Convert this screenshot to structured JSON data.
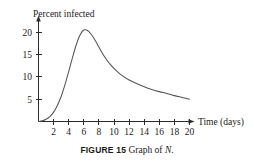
{
  "caption": {
    "figure_number": "FIGURE 15",
    "text": "Graph of",
    "symbol": "N",
    "terminator": "."
  },
  "chart_data": {
    "type": "line",
    "title": "",
    "xlabel": "Time (days)",
    "ylabel": "Percent infected",
    "xlim": [
      0,
      21.5
    ],
    "ylim": [
      0,
      23
    ],
    "grid": false,
    "legend": null,
    "x_ticks": [
      2,
      4,
      6,
      8,
      10,
      12,
      14,
      16,
      18,
      20
    ],
    "x_tick_labels": [
      "2",
      "4",
      "6",
      "8",
      "10",
      "12",
      "14",
      "16",
      "18",
      "20"
    ],
    "y_ticks": [
      5,
      10,
      15,
      20
    ],
    "y_tick_labels": [
      "5",
      "10",
      "15",
      "20"
    ],
    "series": [
      {
        "name": "N",
        "x": [
          0,
          0.5,
          1,
          1.5,
          2,
          2.5,
          3,
          3.5,
          4,
          4.5,
          5,
          5.5,
          6,
          6.5,
          7,
          7.5,
          8,
          8.5,
          9,
          9.5,
          10,
          11,
          12,
          13,
          14,
          15,
          16,
          17,
          18,
          19,
          20
        ],
        "y": [
          0,
          0.15,
          0.5,
          1.1,
          2.1,
          3.6,
          5.6,
          8.2,
          11.2,
          14.3,
          17.2,
          19.4,
          20.5,
          20.4,
          19.5,
          18.2,
          16.7,
          15.2,
          13.9,
          12.8,
          11.9,
          10.4,
          9.3,
          8.5,
          7.8,
          7.2,
          6.7,
          6.3,
          5.8,
          5.4,
          5.0
        ]
      }
    ],
    "peak": {
      "x": 6,
      "y": 20.5
    },
    "endpoint": {
      "x": 20,
      "y": 5.0
    },
    "origin": {
      "x": 0,
      "y": 0
    }
  }
}
